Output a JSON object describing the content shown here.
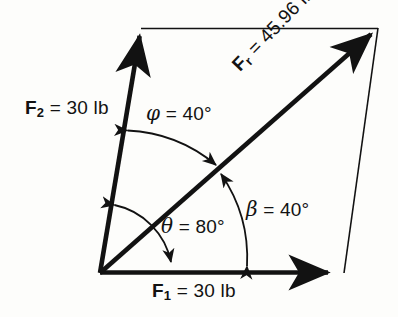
{
  "figure": {
    "background_color": "#fdfdfb",
    "ink_color": "#121212"
  },
  "labels": {
    "f1": {
      "symbol": "F",
      "subscript": "1",
      "equals": "=",
      "value": "30 lb",
      "text": "F1 = 30 lb"
    },
    "f2": {
      "symbol": "F",
      "subscript": "2",
      "equals": "=",
      "value": "30 lb",
      "text": "F2 = 30 lb"
    },
    "fr": {
      "symbol": "F",
      "subscript": "r",
      "equals": "=",
      "value": "45.96 lb",
      "text": "Fr = 45.96 lb"
    },
    "phi": {
      "symbol": "ϕ",
      "equals": "=",
      "value": "40°",
      "text": "ϕ = 40°"
    },
    "theta": {
      "symbol": "θ",
      "equals": "=",
      "value": "80°",
      "text": "θ = 80°"
    },
    "beta": {
      "symbol": "β",
      "equals": "=",
      "value": "40°",
      "text": "β = 40°"
    }
  },
  "vectors": [
    {
      "name": "F1",
      "magnitude": "30 lb",
      "from": [
        100,
        273
      ],
      "to": [
        336,
        273
      ]
    },
    {
      "name": "F2",
      "magnitude": "30 lb",
      "from": [
        100,
        273
      ],
      "to": [
        141,
        28
      ]
    },
    {
      "name": "Fr",
      "magnitude": "45.96 lb",
      "from": [
        100,
        273
      ],
      "to": [
        378,
        28
      ]
    }
  ],
  "construction_lines": [
    {
      "name": "top-side",
      "from": [
        141,
        28
      ],
      "to": [
        378,
        28
      ]
    },
    {
      "name": "right-side",
      "from": [
        378,
        28
      ],
      "to": [
        344,
        273
      ]
    }
  ],
  "angles": [
    {
      "name": "phi",
      "value": "40°",
      "between": [
        "F2",
        "Fr"
      ]
    },
    {
      "name": "theta",
      "value": "80°",
      "between": [
        "F1",
        "F2"
      ]
    },
    {
      "name": "beta",
      "value": "40°",
      "between": [
        "F1",
        "Fr"
      ]
    }
  ]
}
